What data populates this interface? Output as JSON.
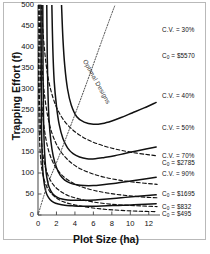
{
  "chart_data": {
    "type": "line",
    "title": "",
    "xlabel": "Plot Size (ha)",
    "ylabel": "Trapping Effort (f)",
    "xlim": [
      0,
      13
    ],
    "ylim": [
      0,
      500
    ],
    "xticks": [
      0,
      2,
      4,
      6,
      8,
      10,
      12
    ],
    "yticks": [
      0,
      50,
      100,
      150,
      200,
      250,
      300,
      350,
      400,
      450,
      500
    ],
    "grid": false,
    "legend_position": "right-inline-labels",
    "series": [
      {
        "name": "C.V. = 30%",
        "style": "solid",
        "kind": "cv-isoline",
        "label": "C.V. = 30%",
        "label_x": 12.6,
        "label_y": 432,
        "points": [
          [
            2.55,
            500
          ],
          [
            2.7,
            420
          ],
          [
            2.9,
            355
          ],
          [
            3.2,
            300
          ],
          [
            3.6,
            262
          ],
          [
            4.2,
            234
          ],
          [
            5.0,
            221
          ],
          [
            6.0,
            216
          ],
          [
            7.0,
            218
          ],
          [
            8.0,
            224
          ],
          [
            9.0,
            232
          ],
          [
            10.2,
            243
          ],
          [
            11.5,
            255
          ],
          [
            12.8,
            268
          ]
        ],
        "min_point": [
          6.0,
          216
        ]
      },
      {
        "name": "C.V. = 40%",
        "style": "solid",
        "kind": "cv-isoline",
        "label": "C.V. = 40%",
        "label_x": 12.6,
        "label_y": 300,
        "points": [
          [
            1.5,
            500
          ],
          [
            1.6,
            400
          ],
          [
            1.75,
            320
          ],
          [
            2.0,
            260
          ],
          [
            2.3,
            215
          ],
          [
            2.7,
            182
          ],
          [
            3.2,
            160
          ],
          [
            3.8,
            146
          ],
          [
            4.5,
            138
          ],
          [
            5.3,
            134
          ],
          [
            6.2,
            134
          ],
          [
            7.2,
            137
          ],
          [
            8.3,
            141
          ],
          [
            9.5,
            147
          ],
          [
            10.8,
            153
          ],
          [
            12.8,
            162
          ]
        ],
        "min_point": [
          5.7,
          133
        ]
      },
      {
        "name": "C.V. = 50%",
        "style": "solid",
        "kind": "cv-isoline",
        "label": "C.V. = 50%",
        "label_x": 12.6,
        "label_y": 228,
        "points": [
          [
            0.95,
            500
          ],
          [
            1.0,
            380
          ],
          [
            1.08,
            290
          ],
          [
            1.2,
            225
          ],
          [
            1.4,
            175
          ],
          [
            1.65,
            140
          ],
          [
            2.0,
            113
          ],
          [
            2.4,
            95
          ],
          [
            2.9,
            83
          ],
          [
            3.5,
            76
          ],
          [
            4.2,
            72
          ],
          [
            5.0,
            70
          ],
          [
            6.0,
            70
          ],
          [
            7.0,
            72
          ],
          [
            8.2,
            75
          ],
          [
            9.5,
            79
          ],
          [
            11.0,
            84
          ],
          [
            12.8,
            90
          ]
        ],
        "min_point": [
          5.5,
          69
        ]
      },
      {
        "name": "C.V. = 70%",
        "style": "solid",
        "kind": "cv-isoline",
        "label": "C.V. = 70%",
        "label_x": 12.6,
        "label_y": 165,
        "points": [
          [
            0.52,
            500
          ],
          [
            0.55,
            330
          ],
          [
            0.6,
            230
          ],
          [
            0.68,
            165
          ],
          [
            0.8,
            120
          ],
          [
            0.95,
            90
          ],
          [
            1.15,
            70
          ],
          [
            1.4,
            57
          ],
          [
            1.7,
            48
          ],
          [
            2.1,
            42
          ],
          [
            2.6,
            38
          ],
          [
            3.2,
            36
          ],
          [
            4.0,
            35
          ],
          [
            5.0,
            35
          ],
          [
            6.2,
            36
          ],
          [
            7.5,
            38
          ],
          [
            9.0,
            41
          ],
          [
            10.5,
            44
          ],
          [
            12.8,
            48
          ]
        ],
        "min_point": [
          4.5,
          35
        ]
      },
      {
        "name": "C.V. = 90%",
        "style": "solid",
        "kind": "cv-isoline",
        "label": "C.V. = 90%",
        "label_x": 12.6,
        "label_y": 124,
        "points": [
          [
            0.33,
            500
          ],
          [
            0.35,
            320
          ],
          [
            0.38,
            215
          ],
          [
            0.44,
            150
          ],
          [
            0.52,
            108
          ],
          [
            0.64,
            80
          ],
          [
            0.8,
            60
          ],
          [
            1.0,
            47
          ],
          [
            1.3,
            37
          ],
          [
            1.7,
            30
          ],
          [
            2.2,
            26
          ],
          [
            2.9,
            23
          ],
          [
            3.7,
            22
          ],
          [
            4.7,
            21
          ],
          [
            6.0,
            21
          ],
          [
            7.5,
            22
          ],
          [
            9.2,
            23
          ],
          [
            11.0,
            25
          ],
          [
            12.8,
            27
          ]
        ],
        "min_point": [
          5.2,
          21
        ]
      },
      {
        "name": "C0 = $5570",
        "style": "dashed",
        "kind": "cost-isoline",
        "label": "C<sub>0</sub> = $5570",
        "label_x": 12.6,
        "label_y": 372,
        "points": [
          [
            0.35,
            500
          ],
          [
            0.6,
            420
          ],
          [
            0.9,
            355
          ],
          [
            1.3,
            305
          ],
          [
            1.9,
            262
          ],
          [
            2.6,
            232
          ],
          [
            3.5,
            208
          ],
          [
            4.6,
            189
          ],
          [
            5.8,
            175
          ],
          [
            7.2,
            164
          ],
          [
            8.6,
            156
          ],
          [
            10.2,
            149
          ],
          [
            11.8,
            144
          ],
          [
            12.9,
            141
          ]
        ]
      },
      {
        "name": "C0 = $2785",
        "style": "dashed",
        "kind": "cost-isoline",
        "label": "C<sub>0</sub> = $2785",
        "label_x": 12.6,
        "label_y": 150,
        "points": [
          [
            0.2,
            500
          ],
          [
            0.35,
            395
          ],
          [
            0.55,
            320
          ],
          [
            0.85,
            262
          ],
          [
            1.25,
            215
          ],
          [
            1.8,
            178
          ],
          [
            2.5,
            150
          ],
          [
            3.4,
            128
          ],
          [
            4.5,
            111
          ],
          [
            5.8,
            99
          ],
          [
            7.2,
            90
          ],
          [
            8.8,
            83
          ],
          [
            10.5,
            78
          ],
          [
            12.9,
            73
          ]
        ]
      },
      {
        "name": "C0 = $1695",
        "style": "dashed",
        "kind": "cost-isoline",
        "label": "C<sub>0</sub> = $1695",
        "label_x": 12.6,
        "label_y": 76,
        "points": [
          [
            0.12,
            500
          ],
          [
            0.22,
            372
          ],
          [
            0.35,
            290
          ],
          [
            0.55,
            230
          ],
          [
            0.85,
            182
          ],
          [
            1.25,
            146
          ],
          [
            1.8,
            118
          ],
          [
            2.5,
            97
          ],
          [
            3.4,
            81
          ],
          [
            4.6,
            68
          ],
          [
            6.0,
            59
          ],
          [
            7.6,
            52
          ],
          [
            9.3,
            47
          ],
          [
            11.2,
            43
          ],
          [
            12.9,
            41
          ]
        ]
      },
      {
        "name": "C0 = $832",
        "style": "dashed",
        "kind": "cost-isoline",
        "label": "C<sub>0</sub> = $832",
        "label_x": 12.6,
        "label_y": 39,
        "points": [
          [
            0.06,
            500
          ],
          [
            0.12,
            330
          ],
          [
            0.2,
            245
          ],
          [
            0.33,
            188
          ],
          [
            0.52,
            146
          ],
          [
            0.8,
            114
          ],
          [
            1.2,
            89
          ],
          [
            1.7,
            71
          ],
          [
            2.4,
            57
          ],
          [
            3.3,
            46
          ],
          [
            4.5,
            38
          ],
          [
            6.0,
            31
          ],
          [
            7.8,
            26
          ],
          [
            9.8,
            23
          ],
          [
            11.8,
            21
          ],
          [
            12.9,
            20
          ]
        ]
      },
      {
        "name": "C0 = $495",
        "style": "dashed",
        "kind": "cost-isoline",
        "label": "C<sub>0</sub> = $495",
        "label_x": 12.6,
        "label_y": 16,
        "points": [
          [
            0.04,
            400
          ],
          [
            0.08,
            270
          ],
          [
            0.14,
            200
          ],
          [
            0.23,
            152
          ],
          [
            0.37,
            117
          ],
          [
            0.58,
            91
          ],
          [
            0.88,
            71
          ],
          [
            1.3,
            55
          ],
          [
            1.9,
            42
          ],
          [
            2.7,
            32
          ],
          [
            3.8,
            25
          ],
          [
            5.2,
            19
          ],
          [
            7.0,
            14
          ],
          [
            9.0,
            11
          ],
          [
            11.0,
            9
          ],
          [
            12.9,
            8
          ]
        ]
      },
      {
        "name": "Optimal Designs",
        "style": "dotted",
        "kind": "locus",
        "label": "Optimal Designs",
        "points": [
          [
            0.0,
            0
          ],
          [
            1.0,
            70
          ],
          [
            2.1,
            130
          ],
          [
            3.6,
            216
          ],
          [
            5.2,
            310
          ],
          [
            7.0,
            420
          ],
          [
            8.0,
            480
          ],
          [
            8.35,
            500
          ]
        ]
      }
    ],
    "annotations": [
      {
        "id": "cv30",
        "text": "C.V. = 30%",
        "x_px": 162,
        "y_px": 26
      },
      {
        "id": "c5570",
        "text": "C₀ = $5570",
        "x_px": 162,
        "y_px": 52
      },
      {
        "id": "cv40",
        "text": "C.V. = 40%",
        "x_px": 162,
        "y_px": 92
      },
      {
        "id": "cv50",
        "text": "C.V. = 50%",
        "x_px": 162,
        "y_px": 124
      },
      {
        "id": "cv70",
        "text": "C.V. = 70%",
        "x_px": 162,
        "y_px": 152
      },
      {
        "id": "c2785",
        "text": "C₀ = $2785",
        "x_px": 162,
        "y_px": 159
      },
      {
        "id": "cv90",
        "text": "C.V. = 90%",
        "x_px": 162,
        "y_px": 170
      },
      {
        "id": "c1695",
        "text": "C₀ = $1695",
        "x_px": 162,
        "y_px": 190
      },
      {
        "id": "c832",
        "text": "C₀ = $832",
        "x_px": 162,
        "y_px": 203
      },
      {
        "id": "c495",
        "text": "C₀ = $495",
        "x_px": 162,
        "y_px": 210
      },
      {
        "id": "optimal",
        "text": "Optimal Designs",
        "x_px": 88,
        "y_px": 58
      }
    ]
  },
  "axes": {
    "y_title": "Trapping Effort (f)",
    "x_title": "Plot Size (ha)",
    "y_tick_labels": [
      "500",
      "450",
      "400",
      "350",
      "300",
      "250",
      "200",
      "150",
      "100",
      "50",
      "0"
    ],
    "x_tick_labels": [
      "0",
      "2",
      "4",
      "6",
      "8",
      "10",
      "12"
    ]
  },
  "colors": {
    "line": "#111111",
    "frame": "#b9b9b9",
    "axis": "#555555",
    "background": "#ffffff"
  }
}
